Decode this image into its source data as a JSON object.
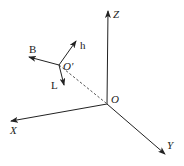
{
  "diagram": {
    "title": "",
    "colors": {
      "line": "#222222",
      "dashed": "#444444",
      "background": "#ffffff"
    },
    "origin": {
      "label": "O",
      "x": 107,
      "y": 104
    },
    "axes": [
      {
        "id": "Z",
        "label": "Z",
        "tip": [
          108,
          10
        ]
      },
      {
        "id": "X",
        "label": "X",
        "tip": [
          10,
          121
        ]
      },
      {
        "id": "Y",
        "label": "Y",
        "tip": [
          166,
          155
        ]
      }
    ],
    "local_frame": {
      "origin": {
        "label": "O'",
        "x": 59,
        "y": 65
      },
      "vectors": [
        {
          "id": "B",
          "label": "B",
          "tip": [
            28,
            56
          ]
        },
        {
          "id": "h",
          "label": "h",
          "tip": [
            77,
            40
          ]
        },
        {
          "id": "L",
          "label": "L",
          "tip": [
            64,
            86
          ]
        }
      ]
    },
    "connector": {
      "style": "dashed",
      "from": "O'",
      "to": "O"
    }
  }
}
